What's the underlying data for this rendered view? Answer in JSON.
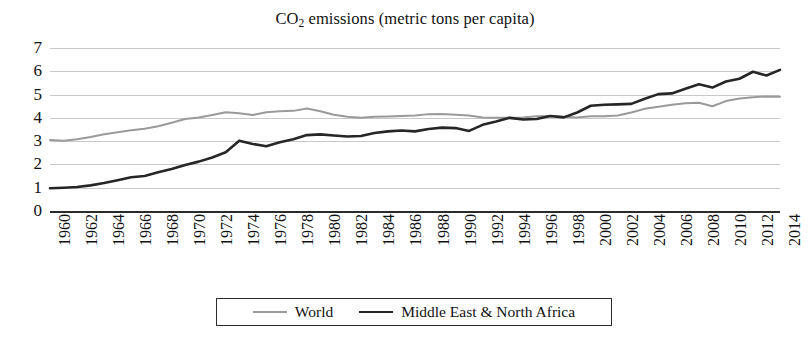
{
  "chart_data": {
    "type": "line",
    "title": "CO2 emissions (metric tons per capita)",
    "title_main": "CO",
    "title_sub": "2",
    "title_rest": " emissions (metric tons per capita)",
    "xlabel": "",
    "ylabel": "",
    "ylim": [
      0,
      7
    ],
    "xlim": [
      1960,
      2014
    ],
    "grid": true,
    "legend_position": "bottom",
    "y_ticks": [
      7,
      6,
      5,
      4,
      3,
      2,
      1,
      0
    ],
    "x_ticks": [
      "1960",
      "1962",
      "1964",
      "1966",
      "1968",
      "1970",
      "1972",
      "1974",
      "1976",
      "1978",
      "1980",
      "1982",
      "1984",
      "1986",
      "1988",
      "1990",
      "1992",
      "1994",
      "1996",
      "1998",
      "2000",
      "2002",
      "2004",
      "2006",
      "2008",
      "2010",
      "2012",
      "2014"
    ],
    "x": [
      1960,
      1961,
      1962,
      1963,
      1964,
      1965,
      1966,
      1967,
      1968,
      1969,
      1970,
      1971,
      1972,
      1973,
      1974,
      1975,
      1976,
      1977,
      1978,
      1979,
      1980,
      1981,
      1982,
      1983,
      1984,
      1985,
      1986,
      1987,
      1988,
      1989,
      1990,
      1991,
      1992,
      1993,
      1994,
      1995,
      1996,
      1997,
      1998,
      1999,
      2000,
      2001,
      2002,
      2003,
      2004,
      2005,
      2006,
      2007,
      2008,
      2009,
      2010,
      2011,
      2012,
      2013,
      2014
    ],
    "series": [
      {
        "name": "World",
        "color": "#9a9a9a",
        "width": 2.0,
        "values": [
          3.05,
          3.02,
          3.08,
          3.18,
          3.3,
          3.38,
          3.47,
          3.53,
          3.64,
          3.79,
          3.95,
          4.02,
          4.12,
          4.24,
          4.2,
          4.12,
          4.24,
          4.28,
          4.3,
          4.4,
          4.28,
          4.13,
          4.05,
          4.0,
          4.05,
          4.06,
          4.08,
          4.1,
          4.16,
          4.17,
          4.13,
          4.1,
          4.02,
          4.0,
          4.0,
          4.02,
          4.07,
          4.08,
          4.05,
          4.02,
          4.07,
          4.07,
          4.1,
          4.23,
          4.39,
          4.48,
          4.56,
          4.63,
          4.65,
          4.5,
          4.72,
          4.83,
          4.88,
          4.92,
          4.91
        ]
      },
      {
        "name": "Middle East & North Africa",
        "color": "#262626",
        "width": 2.6,
        "values": [
          0.98,
          1.0,
          1.03,
          1.1,
          1.2,
          1.32,
          1.45,
          1.5,
          1.66,
          1.8,
          1.98,
          2.12,
          2.3,
          2.52,
          3.02,
          2.88,
          2.78,
          2.95,
          3.08,
          3.26,
          3.29,
          3.24,
          3.2,
          3.22,
          3.35,
          3.42,
          3.46,
          3.42,
          3.52,
          3.58,
          3.56,
          3.44,
          3.7,
          3.84,
          4.0,
          3.93,
          3.95,
          4.08,
          4.02,
          4.23,
          4.52,
          4.56,
          4.58,
          4.6,
          4.82,
          5.02,
          5.05,
          5.25,
          5.44,
          5.3,
          5.56,
          5.68,
          5.98,
          5.82,
          6.06
        ]
      }
    ]
  },
  "legend": {
    "entries": [
      {
        "label": "World"
      },
      {
        "label": "Middle East & North Africa"
      }
    ]
  }
}
